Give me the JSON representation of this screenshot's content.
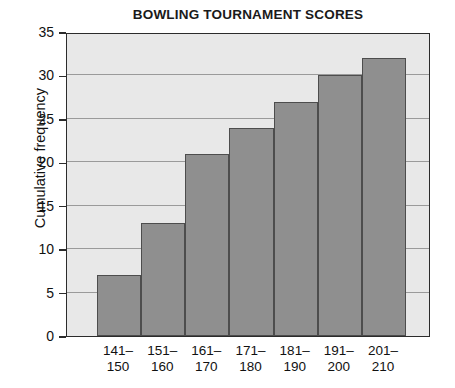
{
  "chart_data": {
    "type": "bar",
    "title": "BOWLING TOURNAMENT SCORES",
    "xlabel": "",
    "ylabel": "Cumulative frequency",
    "categories": [
      "141–150",
      "151–160",
      "161–170",
      "171–180",
      "181–190",
      "191–200",
      "201–210"
    ],
    "category_lines": [
      [
        "141–",
        "150"
      ],
      [
        "151–",
        "160"
      ],
      [
        "161–",
        "170"
      ],
      [
        "171–",
        "180"
      ],
      [
        "181–",
        "190"
      ],
      [
        "191–",
        "200"
      ],
      [
        "201–",
        "210"
      ]
    ],
    "values": [
      7,
      13,
      21,
      24,
      27,
      30,
      32
    ],
    "ylim": [
      0,
      35
    ],
    "ytick_values": [
      0,
      5,
      10,
      15,
      20,
      25,
      30,
      35
    ],
    "ytick_labels": [
      "0",
      "5",
      "10",
      "15",
      "20",
      "25",
      "30",
      "35"
    ],
    "grid": true,
    "grid_axis": "y",
    "legend": false,
    "bar_color": "#8f8f8f",
    "bar_edge_color": "#4d4d4d",
    "plot_background": "#e8e8e8",
    "axis_color": "#2b2b2b",
    "gridline_color": "#9a9a9a",
    "text_color": "#111111"
  }
}
